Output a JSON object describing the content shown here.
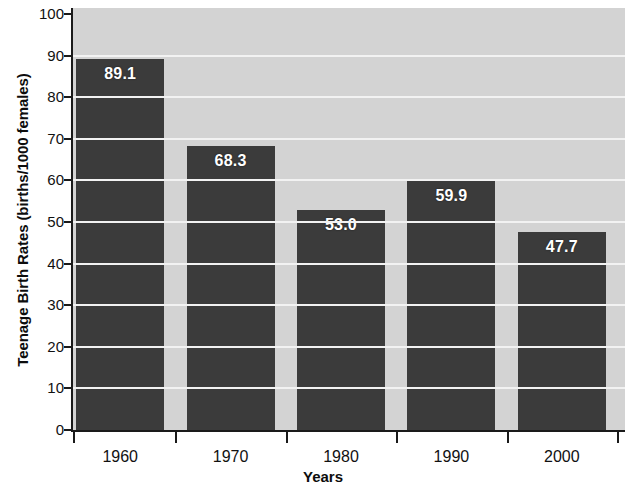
{
  "chart_data": {
    "type": "bar",
    "title": "",
    "xlabel": "Years",
    "ylabel": "Teenage Birth Rates (births/1000 females)",
    "categories": [
      "1960",
      "1970",
      "1980",
      "1990",
      "2000"
    ],
    "values": [
      89.1,
      68.3,
      53.0,
      59.9,
      47.7
    ],
    "value_labels": [
      "89.1",
      "68.3",
      "53.0",
      "59.9",
      "47.7"
    ],
    "ylim": [
      0,
      100
    ],
    "ytick_labels": [
      "0",
      "10",
      "20",
      "30",
      "40",
      "50",
      "60",
      "70",
      "80",
      "90",
      "100"
    ],
    "ytick_values": [
      0,
      10,
      20,
      30,
      40,
      50,
      60,
      70,
      80,
      90,
      100
    ],
    "grid": true,
    "grid_axis": "y",
    "legend": false,
    "legend_position": "none",
    "colors": {
      "bar": "#3b3b3b",
      "plot_background": "#d3d3d3",
      "gridline": "#f2f2f2",
      "axis": "#1a1a1a",
      "value_label": "#ffffff",
      "tick_label": "#111111",
      "axis_title": "#0d0d0d",
      "page_background": "#ffffff"
    }
  }
}
